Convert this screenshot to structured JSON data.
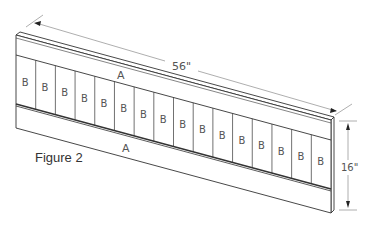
{
  "figure": {
    "caption": "Figure 2",
    "rail_label": "A",
    "board_label": "B",
    "board_count": 16,
    "dimensions": {
      "width_label": "56\"",
      "height_label": "16\""
    },
    "rails": [
      {
        "position": "top",
        "label": "A"
      },
      {
        "position": "bottom",
        "label": "A"
      }
    ],
    "boards": [
      "B",
      "B",
      "B",
      "B",
      "B",
      "B",
      "B",
      "B",
      "B",
      "B",
      "B",
      "B",
      "B",
      "B",
      "B",
      "B"
    ]
  }
}
